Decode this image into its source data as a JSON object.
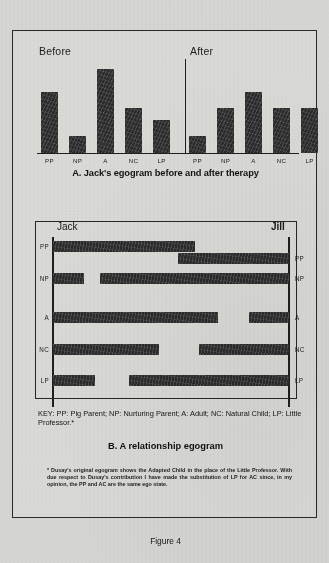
{
  "figure": {
    "number_label": "Figure 4"
  },
  "panel_a": {
    "group_before_label": "Before",
    "group_after_label": "After",
    "caption": "A. Jack's egogram before and after therapy"
  },
  "panel_b": {
    "left_person": "Jack",
    "right_person": "Jill",
    "caption": "B. A relationship egogram",
    "key_text": "KEY: PP: Pig Parent; NP: Nurturing Parent; A: Adult; NC: Natural Child; LP: Little Professor.*",
    "footnote": "* Dusay's original egogram shows the Adapted Child in the place of the Little Professor. With due respect to Dusay's contribution I have made the substitution of LP for AC since, in my opinion, the PP and AC are the same ego state."
  },
  "chart_data": [
    {
      "type": "bar",
      "title": "A. Jack's egogram before and after therapy",
      "xlabel": "",
      "ylabel": "",
      "ylim": [
        0,
        100
      ],
      "grid": false,
      "legend": "none",
      "categories": [
        "PP",
        "NP",
        "A",
        "NC",
        "LP"
      ],
      "series": [
        {
          "name": "Before",
          "values": [
            50,
            14,
            69,
            37,
            27
          ]
        },
        {
          "name": "After",
          "values": [
            14,
            37,
            50,
            37,
            37
          ]
        }
      ]
    },
    {
      "type": "bar",
      "orientation": "horizontal-diverging",
      "title": "B. A relationship egogram",
      "left_person": "Jack",
      "right_person": "Jill",
      "categories": [
        "PP",
        "NP",
        "A",
        "NC",
        "LP"
      ],
      "note": "Bar extents given as percent of the Jack-axis (left, 0%) to Jill-axis (right, 100%) span.",
      "series": [
        {
          "name": "Jack",
          "bars": [
            {
              "category": "PP",
              "start_pct": 0,
              "end_pct": 60
            },
            {
              "category": "NP",
              "start_pct": 0,
              "end_pct": 13
            },
            {
              "category": "A",
              "start_pct": 0,
              "end_pct": 70
            },
            {
              "category": "NC",
              "start_pct": 0,
              "end_pct": 45
            },
            {
              "category": "LP",
              "start_pct": 0,
              "end_pct": 18
            }
          ]
        },
        {
          "name": "Jill",
          "bars": [
            {
              "category": "PP",
              "start_pct": 53,
              "end_pct": 100
            },
            {
              "category": "NP",
              "start_pct": 20,
              "end_pct": 100
            },
            {
              "category": "A",
              "start_pct": 83,
              "end_pct": 100
            },
            {
              "category": "NC",
              "start_pct": 62,
              "end_pct": 100
            },
            {
              "category": "LP",
              "start_pct": 32,
              "end_pct": 100
            }
          ]
        }
      ]
    }
  ],
  "ticks": {
    "before": [
      "PP",
      "NP",
      "A",
      "NC",
      "LP"
    ],
    "after": [
      "PP",
      "NP",
      "A",
      "NC",
      "LP"
    ],
    "rows_left": [
      "PP",
      "NP",
      "A",
      "NC",
      "LP"
    ],
    "rows_right": [
      "PP",
      "NP",
      "A",
      "NC",
      "LP"
    ]
  }
}
